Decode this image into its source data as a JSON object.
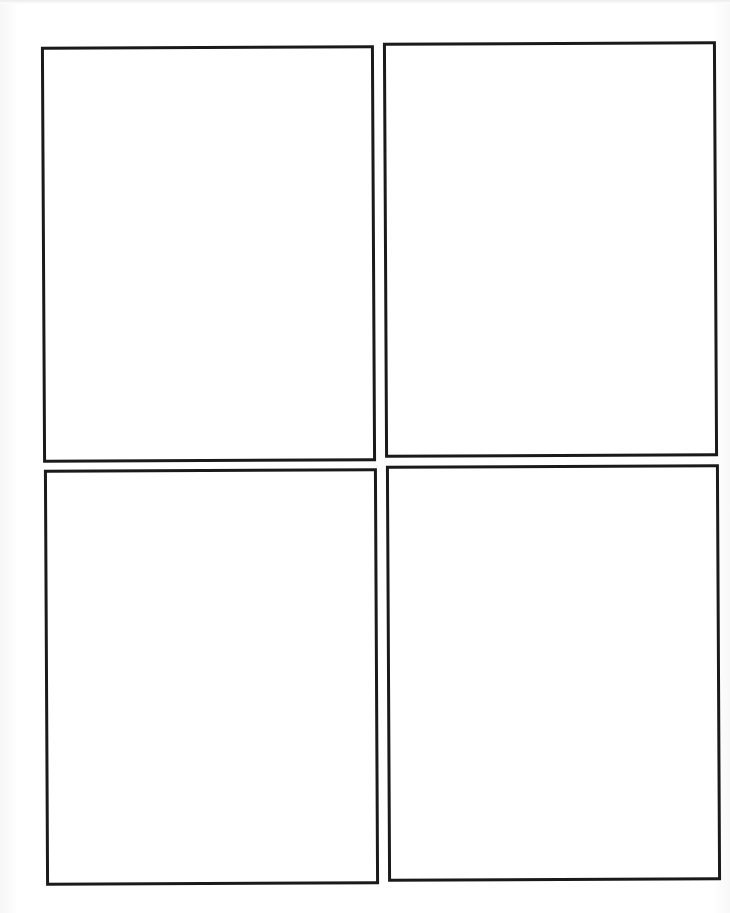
{
  "page": {
    "type": "comic storyboard template",
    "layout": "2x2 grid",
    "background_color": "#ffffff",
    "border_color": "#1a1a1a"
  },
  "panels": [
    {
      "label": "Panel 1",
      "position": "top-left",
      "content": ""
    },
    {
      "label": "Panel 2",
      "position": "top-right",
      "content": ""
    },
    {
      "label": "Panel 3",
      "position": "bottom-left",
      "content": ""
    },
    {
      "label": "Panel 4",
      "position": "bottom-right",
      "content": ""
    }
  ]
}
